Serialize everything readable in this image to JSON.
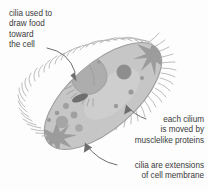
{
  "figure": {
    "background_color": "#fdfdfd",
    "text_color": "#3b3b3b",
    "cell_body_color": "#c6c6c6",
    "cell_outline_color": "#9a9a9a",
    "organelle_color": "#a8a8a8",
    "organelle_dark_color": "#8a8a8a",
    "cilia_color": "#b0b0b0",
    "leader_line_color": "#6e6e6e"
  },
  "labels": {
    "cilia_food": {
      "line1": "cilia used to",
      "line2": "draw food",
      "line3": "toward",
      "line4": "the cell"
    },
    "each_cilium": {
      "line1": "each cilium",
      "line2": "is moved by",
      "line3": "musclelike proteins"
    },
    "cilia_extensions": {
      "line1": "cilia are extensions",
      "line2": "of cell membrane"
    }
  }
}
